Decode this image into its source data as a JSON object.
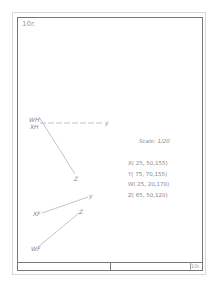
{
  "sheet": {
    "number": "10r.",
    "title_block_number": "10r."
  },
  "scale": "Scale: 1/20",
  "coordinates": [
    {
      "label": "X",
      "text": "X( 25, 50,155)"
    },
    {
      "label": "Y",
      "text": "Y( 75, 70,155)"
    },
    {
      "label": "W",
      "text": "W( 25, 20,170)"
    },
    {
      "label": "Z",
      "text": "Z( 65, 50,120)"
    }
  ],
  "top_view_labels": {
    "wh": "WH",
    "xh": "XH",
    "y": "y",
    "z": "Z"
  },
  "front_view_labels": {
    "xf": "XF",
    "y": "y",
    "z": "Z",
    "wf": "WF"
  }
}
